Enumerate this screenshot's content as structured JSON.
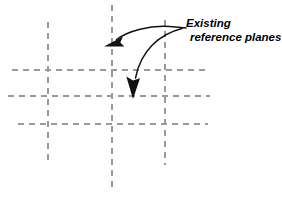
{
  "figure": {
    "background_color": "#ffffff",
    "grid_color": "#9a9a9a",
    "annotation_color": "#111111",
    "width": 282,
    "height": 197
  },
  "callout": {
    "line1": "Existing",
    "line2": "reference planes",
    "full_text": "Existing reference planes",
    "style": "bold italic",
    "color": "#000000"
  },
  "grid": {
    "description": "Dashed reference planes grid",
    "vertical_lines": [
      {
        "id": "vertical-plane-left",
        "x": 48,
        "y1": 22,
        "y2": 165
      },
      {
        "id": "vertical-plane-center",
        "x": 112,
        "y1": 5,
        "y2": 190
      },
      {
        "id": "vertical-plane-right",
        "x": 165,
        "y1": 20,
        "y2": 165
      }
    ],
    "horizontal_lines": [
      {
        "id": "horizontal-plane-top",
        "y": 70,
        "x1": 12,
        "x2": 205
      },
      {
        "id": "horizontal-plane-middle",
        "y": 96,
        "x1": 8,
        "x2": 210
      },
      {
        "id": "horizontal-plane-bottom",
        "y": 124,
        "x1": 18,
        "x2": 208
      }
    ]
  },
  "leaders": [
    {
      "id": "leader-arrow-upper",
      "target": "vertical-plane-center",
      "path": "M 185 28 L 172 27 C 152 25 126 32 112 42",
      "arrow_tip": {
        "x": 104,
        "y": 46
      }
    },
    {
      "id": "leader-arrow-lower",
      "target": "horizontal-plane-middle",
      "path": "M 181 28 C 158 33 140 50 134 80",
      "arrow_tip": {
        "x": 133,
        "y": 98
      }
    }
  ]
}
